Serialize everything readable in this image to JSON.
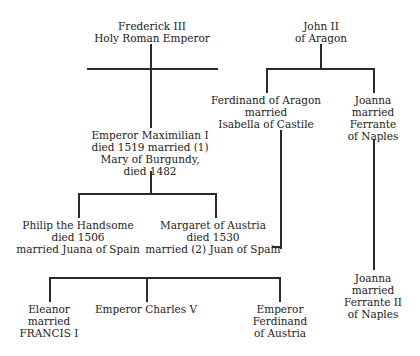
{
  "diagram": {
    "type": "family-tree",
    "nodes": [
      {
        "id": "frederick",
        "lines": [
          "Frederick III",
          "Holy Roman Emperor"
        ]
      },
      {
        "id": "john",
        "lines": [
          "John II",
          "of Aragon"
        ]
      },
      {
        "id": "ferdinand_aragon",
        "lines": [
          "Ferdinand of Aragon",
          "married",
          "Isabella of Castile"
        ]
      },
      {
        "id": "joanna1",
        "lines": [
          "Joanna",
          "married",
          "Ferrante",
          "of Naples"
        ]
      },
      {
        "id": "maximilian",
        "lines": [
          "Emperor Maximilian I",
          "died 1519 married (1)",
          "Mary of Burgundy,",
          "died 1482"
        ]
      },
      {
        "id": "philip",
        "lines": [
          "Philip the Handsome",
          "died 1506",
          "married Juana of Spain"
        ]
      },
      {
        "id": "margaret",
        "lines": [
          "Margaret of Austria",
          "died 1530",
          "married (2) Juan of Spain"
        ]
      },
      {
        "id": "joanna2",
        "lines": [
          "Joanna",
          "married",
          "Ferrante II",
          "of Naples"
        ]
      },
      {
        "id": "eleanor",
        "lines": [
          "Eleanor",
          "married",
          "FRANCIS I"
        ]
      },
      {
        "id": "charles",
        "lines": [
          "Emperor Charles V"
        ]
      },
      {
        "id": "ferdinand_austria",
        "lines": [
          "Emperor",
          "Ferdinand",
          "of Austria"
        ]
      }
    ],
    "edges": [
      {
        "from": "frederick",
        "to": "maximilian"
      },
      {
        "from": "john",
        "to": "ferdinand_aragon"
      },
      {
        "from": "john",
        "to": "joanna1"
      },
      {
        "from": "maximilian",
        "to": "philip"
      },
      {
        "from": "maximilian",
        "to": "margaret"
      },
      {
        "from": "ferdinand_aragon",
        "to": "margaret",
        "label": "Juan of Spain"
      },
      {
        "from": "joanna1",
        "to": "joanna2"
      },
      {
        "from": "philip",
        "to": "eleanor"
      },
      {
        "from": "philip",
        "to": "charles"
      },
      {
        "from": "philip",
        "to": "ferdinand_austria"
      }
    ]
  }
}
